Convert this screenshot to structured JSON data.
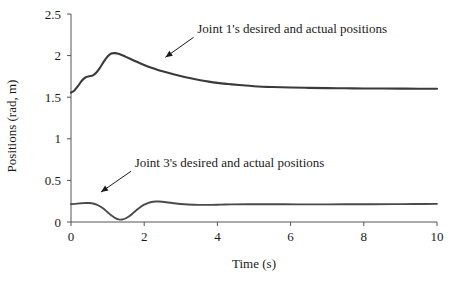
{
  "chart_data": {
    "type": "line",
    "title": "",
    "xlabel": "Time (s)",
    "ylabel": "Positions (rad, m)",
    "xlim": [
      0,
      10
    ],
    "ylim": [
      0,
      2.5
    ],
    "xticks": [
      0,
      2,
      4,
      6,
      8,
      10
    ],
    "xtick_labels": [
      "0",
      "2",
      "4",
      "6",
      "8",
      "10"
    ],
    "yticks": [
      0,
      0.5,
      1,
      1.5,
      2,
      2.5
    ],
    "ytick_labels": [
      "0",
      "0.5",
      "1",
      "1.5",
      "2",
      "2.5"
    ],
    "grid": false,
    "legend": "none",
    "annotations": [
      {
        "text": "Joint 1's desired and actual positions",
        "text_x": 3.45,
        "text_y": 2.27,
        "arrow_from_x": 3.35,
        "arrow_from_y": 2.22,
        "arrow_to_x": 2.58,
        "arrow_to_y": 1.98
      },
      {
        "text": "Joint 3's desired and actual positions",
        "text_x": 1.74,
        "text_y": 0.66,
        "arrow_from_x": 1.64,
        "arrow_from_y": 0.61,
        "arrow_to_x": 0.82,
        "arrow_to_y": 0.36
      }
    ],
    "series": [
      {
        "name": "Joint 1's desired and actual positions",
        "color": "#3a3a3a",
        "x": [
          0.0,
          0.1,
          0.2,
          0.3,
          0.4,
          0.5,
          0.6,
          0.7,
          0.8,
          0.9,
          1.0,
          1.1,
          1.2,
          1.3,
          1.4,
          1.5,
          1.7,
          1.9,
          2.1,
          2.3,
          2.5,
          2.8,
          3.1,
          3.4,
          3.7,
          4.0,
          4.3,
          4.6,
          5.0,
          5.5,
          6.0,
          6.5,
          7.0,
          7.5,
          8.0,
          8.5,
          9.0,
          9.5,
          10.0
        ],
        "y": [
          1.555,
          1.585,
          1.64,
          1.7,
          1.74,
          1.752,
          1.762,
          1.8,
          1.86,
          1.93,
          1.99,
          2.025,
          2.03,
          2.022,
          2.005,
          1.985,
          1.945,
          1.905,
          1.87,
          1.84,
          1.812,
          1.775,
          1.742,
          1.715,
          1.692,
          1.672,
          1.658,
          1.646,
          1.632,
          1.622,
          1.616,
          1.612,
          1.609,
          1.607,
          1.605,
          1.604,
          1.603,
          1.602,
          1.602
        ]
      },
      {
        "name": "Joint 3's desired and actual positions",
        "color": "#4a4a4a",
        "x": [
          0.0,
          0.1,
          0.2,
          0.3,
          0.4,
          0.5,
          0.6,
          0.7,
          0.8,
          0.9,
          1.0,
          1.1,
          1.2,
          1.3,
          1.4,
          1.5,
          1.6,
          1.7,
          1.8,
          1.9,
          2.0,
          2.1,
          2.2,
          2.3,
          2.4,
          2.6,
          2.8,
          3.0,
          3.2,
          3.5,
          3.8,
          4.1,
          4.4,
          4.8,
          5.3,
          5.8,
          6.4,
          7.0,
          7.6,
          8.2,
          8.8,
          9.4,
          10.0
        ],
        "y": [
          0.215,
          0.218,
          0.222,
          0.226,
          0.229,
          0.228,
          0.222,
          0.208,
          0.186,
          0.155,
          0.118,
          0.08,
          0.05,
          0.032,
          0.03,
          0.045,
          0.072,
          0.108,
          0.146,
          0.18,
          0.208,
          0.228,
          0.24,
          0.246,
          0.246,
          0.238,
          0.226,
          0.216,
          0.21,
          0.206,
          0.206,
          0.209,
          0.212,
          0.214,
          0.214,
          0.213,
          0.212,
          0.212,
          0.213,
          0.214,
          0.215,
          0.216,
          0.218
        ]
      }
    ]
  },
  "axis_geometry": {
    "plot_left_px": 71,
    "plot_right_px": 437,
    "plot_bottom_px": 222,
    "plot_top_px": 14
  }
}
